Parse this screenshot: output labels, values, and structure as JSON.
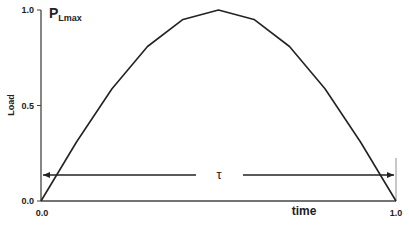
{
  "chart_data": {
    "type": "line",
    "title": "",
    "xlabel": "time",
    "ylabel": "Load",
    "xlim": [
      0.0,
      1.0
    ],
    "ylim": [
      0.0,
      1.0
    ],
    "grid": false,
    "legend": null,
    "x_ticks": [
      "0.0",
      "1.0"
    ],
    "y_ticks": [
      "0.0",
      "0.5",
      "1.0"
    ],
    "x": [
      0.0,
      0.1,
      0.2,
      0.3,
      0.4,
      0.5,
      0.6,
      0.7,
      0.8,
      0.9,
      1.0
    ],
    "series": [
      {
        "name": "Load",
        "values": [
          0.0,
          0.309,
          0.588,
          0.809,
          0.951,
          1.0,
          0.951,
          0.809,
          0.588,
          0.309,
          0.0
        ],
        "color": "#222222"
      }
    ],
    "annotations": {
      "peak_label_main": "P",
      "peak_label_sub": "Lmax",
      "duration_label": "τ",
      "duration_arrow_y": 0.13
    }
  }
}
